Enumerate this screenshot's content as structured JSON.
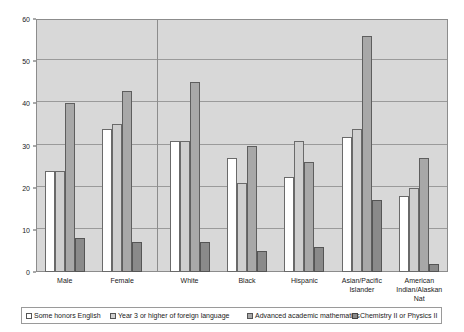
{
  "chart_data": {
    "type": "bar",
    "title": "",
    "subtitle": "",
    "xlabel": "",
    "ylabel": "",
    "ylim": [
      0,
      60
    ],
    "ytick_step": 10,
    "yticks": [
      0,
      10,
      20,
      30,
      40,
      50,
      60
    ],
    "ytick_labels": [
      "0",
      "10",
      "20",
      "30",
      "40",
      "50",
      "60"
    ],
    "grid": true,
    "grid_axis": "y",
    "legend_position": "bottom",
    "categories": [
      "Male",
      "Female",
      "White",
      "Black",
      "Hispanic",
      "Asian/Pacific\nIslander",
      "American\nIndian/Alaskan Nat"
    ],
    "group_separator_after_index": 1,
    "series": [
      {
        "name": "Some honors English",
        "color": "#ffffff",
        "values": [
          24,
          34,
          31,
          27,
          22.5,
          32,
          18
        ]
      },
      {
        "name": "Year 3 or higher of foreign language",
        "color": "#cfcfcf",
        "values": [
          24,
          35,
          31,
          21,
          31,
          34,
          20
        ]
      },
      {
        "name": "Advanced academic mathematics",
        "color": "#a8a8a8",
        "values": [
          40,
          43,
          45,
          30,
          26,
          56,
          27
        ]
      },
      {
        "name": "Chemistry II or Physics II",
        "color": "#8a8a8a",
        "values": [
          8,
          7,
          7,
          5,
          6,
          17,
          2
        ]
      }
    ]
  },
  "legend": {
    "items": [
      "Some honors English",
      "Year 3 or higher of foreign language",
      "Advanced academic mathematics",
      "Chemistry II or Physics II"
    ]
  },
  "colors": {
    "plot_background": "#d8d8d8",
    "page_background": "#ffffff",
    "gridline": "#9a9a9a",
    "axis": "#8c8c8c",
    "text": "#1a1a1a"
  }
}
